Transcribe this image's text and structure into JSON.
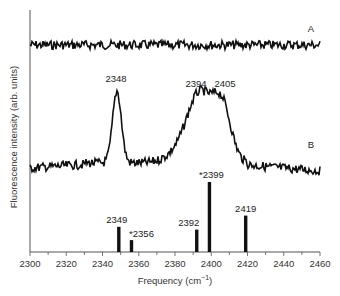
{
  "chart_data": {
    "type": "line",
    "title": "",
    "xlabel": "Frequency (cm⁻¹)",
    "xlabel_base": "Frequency (cm",
    "xlabel_sup": "−1",
    "xlabel_close": ")",
    "ylabel": "Fluorescence intensity (arb. units)",
    "xlim": [
      2300,
      2460
    ],
    "x_ticks": [
      2300,
      2320,
      2340,
      2360,
      2380,
      2400,
      2420,
      2440,
      2460
    ],
    "grid": false,
    "legend": "none",
    "series": [
      {
        "name": "A",
        "description": "Noise-only flat trace",
        "peaks": []
      },
      {
        "name": "B",
        "description": "Spectrum with peaks",
        "peaks": [
          {
            "x": 2348,
            "label": "2348",
            "relative_height": 0.95
          },
          {
            "x": 2394,
            "label": "2394",
            "relative_height": 0.88
          },
          {
            "x": 2405,
            "label": "2405",
            "relative_height": 0.88
          }
        ]
      },
      {
        "name": "stick spectrum",
        "type": "bar",
        "x": [
          2349,
          2356,
          2392,
          2399,
          2419
        ],
        "labels": [
          "2349",
          "*2356",
          "2392",
          "*2399",
          "2419"
        ],
        "values": [
          36,
          17,
          32,
          100,
          52
        ]
      }
    ]
  }
}
